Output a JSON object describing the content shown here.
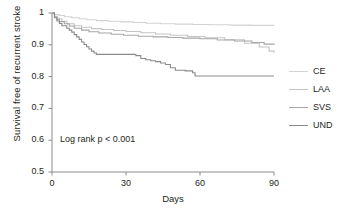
{
  "chart_data": {
    "type": "line",
    "title": "",
    "subtitle": "",
    "xlabel": "Days",
    "ylabel": "Survival free of recurrent stroke",
    "xlim": [
      0,
      90
    ],
    "ylim": [
      0.5,
      1.0
    ],
    "xticks": [
      0,
      30,
      60,
      90
    ],
    "xtick_labels": [
      "0",
      "30",
      "60",
      "90"
    ],
    "yticks": [
      0.5,
      0.6,
      0.7,
      0.8,
      0.9,
      1.0
    ],
    "ytick_labels": [
      "0.5",
      "0.6",
      "0.7",
      "0.8",
      "0.9",
      "1"
    ],
    "grid": false,
    "legend_position": "right",
    "annotation": "Log rank p < 0.001",
    "series": [
      {
        "name": "CE",
        "color": "#d2d2d2",
        "final_value": 0.96,
        "x": [
          0,
          1,
          3,
          5,
          8,
          11,
          14,
          18,
          23,
          28,
          33,
          38,
          44,
          50,
          57,
          64,
          72,
          80,
          90
        ],
        "y": [
          1.0,
          0.995,
          0.992,
          0.988,
          0.985,
          0.982,
          0.979,
          0.976,
          0.974,
          0.972,
          0.97,
          0.968,
          0.966,
          0.965,
          0.964,
          0.963,
          0.962,
          0.961,
          0.96
        ]
      },
      {
        "name": "LAA",
        "color": "#c4c4c4",
        "final_value": 0.875,
        "x": [
          0,
          1,
          2,
          4,
          6,
          9,
          12,
          16,
          20,
          25,
          30,
          36,
          42,
          48,
          55,
          62,
          70,
          78,
          84,
          88,
          90
        ],
        "y": [
          1.0,
          0.99,
          0.982,
          0.974,
          0.966,
          0.96,
          0.955,
          0.951,
          0.948,
          0.945,
          0.942,
          0.938,
          0.934,
          0.93,
          0.926,
          0.922,
          0.916,
          0.905,
          0.893,
          0.88,
          0.875
        ]
      },
      {
        "name": "SVS",
        "color": "#a6a6a6",
        "final_value": 0.9,
        "x": [
          0,
          1,
          2,
          3,
          5,
          7,
          9,
          12,
          15,
          19,
          24,
          29,
          35,
          41,
          47,
          53,
          60,
          67,
          74,
          81,
          86,
          90
        ],
        "y": [
          1.0,
          0.988,
          0.98,
          0.973,
          0.966,
          0.959,
          0.952,
          0.946,
          0.941,
          0.937,
          0.933,
          0.93,
          0.927,
          0.925,
          0.923,
          0.921,
          0.919,
          0.915,
          0.912,
          0.907,
          0.902,
          0.9
        ]
      },
      {
        "name": "UND",
        "color": "#8b8b8b",
        "final_value": 0.802,
        "x": [
          0,
          1,
          2,
          3,
          4,
          6,
          7,
          8,
          9,
          10,
          11,
          12,
          13,
          14,
          15,
          16,
          17,
          18,
          30,
          34,
          36,
          38,
          40,
          42,
          44,
          46,
          48,
          50,
          54,
          57,
          58,
          90
        ],
        "y": [
          1.0,
          0.985,
          0.975,
          0.967,
          0.96,
          0.952,
          0.946,
          0.94,
          0.932,
          0.925,
          0.917,
          0.909,
          0.901,
          0.894,
          0.887,
          0.88,
          0.874,
          0.87,
          0.87,
          0.866,
          0.857,
          0.853,
          0.85,
          0.847,
          0.843,
          0.838,
          0.828,
          0.82,
          0.818,
          0.812,
          0.802,
          0.802
        ]
      }
    ]
  },
  "legend": {
    "items": [
      {
        "label": "CE"
      },
      {
        "label": "LAA"
      },
      {
        "label": "SVS"
      },
      {
        "label": "UND"
      }
    ]
  },
  "axes": {
    "axis_color": "#8a8a8a"
  }
}
